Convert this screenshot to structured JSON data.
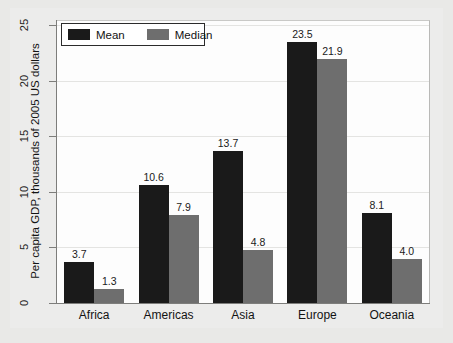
{
  "chart_data": {
    "type": "bar",
    "title": "",
    "xlabel": "",
    "ylabel": "Per capita GDP, thousands of 2005 US dollars",
    "ylim": [
      0,
      25
    ],
    "yticks": [
      "0",
      "5",
      "10",
      "15",
      "20",
      "25"
    ],
    "grid": true,
    "legend_position": "top-left",
    "categories": [
      "Africa",
      "Americas",
      "Asia",
      "Europe",
      "Oceania"
    ],
    "series": [
      {
        "name": "Mean",
        "color": "#1a1a1a",
        "values": [
          3.7,
          10.6,
          13.7,
          23.5,
          8.1
        ],
        "labels": [
          "3.7",
          "10.6",
          "13.7",
          "23.5",
          "8.1"
        ]
      },
      {
        "name": "Median",
        "color": "#6e6e6e",
        "values": [
          1.3,
          7.9,
          4.8,
          21.9,
          4.0
        ],
        "labels": [
          "1.3",
          "7.9",
          "4.8",
          "21.9",
          "4.0"
        ]
      }
    ]
  },
  "legend": {
    "items": [
      {
        "label": "Mean",
        "color": "#1a1a1a"
      },
      {
        "label": "Median",
        "color": "#6e6e6e"
      }
    ]
  },
  "colors": {
    "mean": "#1a1a1a",
    "median": "#6e6e6e",
    "page_background": "#e9e9e7",
    "plot_background": "#fdfdfd",
    "axis": "#7d7d7b",
    "gridline": "#e4e4e2"
  }
}
